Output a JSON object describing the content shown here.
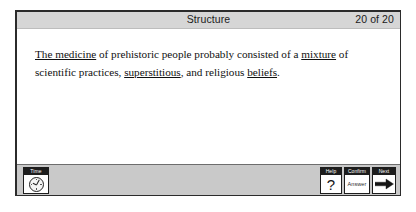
{
  "header": {
    "title": "Structure",
    "counter": "20 of 20"
  },
  "question": {
    "segments": [
      {
        "text": "The medicine",
        "underlined": true
      },
      {
        "text": " of prehistoric people probably consisted of a ",
        "underlined": false
      },
      {
        "text": "mixture",
        "underlined": true
      },
      {
        "text": " of scientific practices, ",
        "underlined": false
      },
      {
        "text": "superstitious",
        "underlined": true
      },
      {
        "text": ", and religious ",
        "underlined": false
      },
      {
        "text": "beliefs",
        "underlined": true
      },
      {
        "text": ".",
        "underlined": false
      }
    ],
    "plain_text": "The medicine of prehistoric people probably consisted of a mixture of scientific practices, superstitious, and religious beliefs."
  },
  "toolbar": {
    "time": {
      "caption": "Time",
      "icon": "clock-icon"
    },
    "help": {
      "caption": "Help",
      "glyph": "?",
      "icon": "question-mark-icon"
    },
    "confirm": {
      "caption": "Confirm",
      "label": "Answer"
    },
    "next": {
      "caption": "Next",
      "icon": "right-arrow-icon"
    }
  },
  "colors": {
    "page_background": "#ffffff",
    "frame_border": "#2b2b2b",
    "header_background": "#d6d6d6",
    "toolbar_background": "#c9c9c9",
    "caption_background": "#1d1d1d",
    "caption_text": "#ffffff",
    "body_text": "#111111"
  }
}
